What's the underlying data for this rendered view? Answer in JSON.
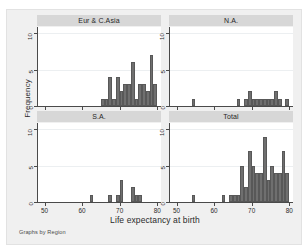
{
  "figure": {
    "xlabel": "Life expectancy at birth",
    "ylabel": "Frequency",
    "note": "Graphs by Region",
    "bar_color": "#6f6f6f",
    "panel_header_color": "#d7d7d7",
    "graph_bg_color": "#f0f0f0",
    "plot_bg_color": "#ffffff"
  },
  "chart_data": {
    "type": "bar",
    "title": "",
    "subtitle": "",
    "xlabel": "Life expectancy at birth",
    "ylabel": "Frequency",
    "note": "Graphs by Region",
    "grid": true,
    "legend": "none",
    "xlim": [
      48,
      81
    ],
    "ylim": [
      0,
      11
    ],
    "xticks": [
      50,
      60,
      70,
      80
    ],
    "yticks": [
      0,
      5,
      10
    ],
    "bin_width": 1,
    "panels": [
      {
        "name": "Eur & C.Asia",
        "row": 0,
        "col": 0,
        "x": [
          65,
          66,
          67,
          68,
          69,
          70,
          71,
          72,
          73,
          74,
          75,
          76,
          77,
          78,
          79
        ],
        "values": [
          1,
          1,
          4,
          1,
          4,
          2,
          3,
          3,
          6,
          1,
          3,
          3,
          2,
          7,
          3
        ]
      },
      {
        "name": "N.A.",
        "row": 0,
        "col": 1,
        "x": [
          54,
          62,
          66,
          67,
          68,
          69,
          70,
          71,
          72,
          73,
          74,
          75,
          76,
          77,
          79
        ],
        "values": [
          1,
          0,
          1,
          0,
          1,
          2,
          1,
          1,
          1,
          1,
          1,
          1,
          2,
          1,
          1
        ]
      },
      {
        "name": "S.A.",
        "row": 1,
        "col": 0,
        "x": [
          62,
          67,
          69,
          70,
          73,
          74,
          75
        ],
        "values": [
          1,
          1,
          1,
          3,
          2,
          1,
          1
        ]
      },
      {
        "name": "Total",
        "row": 1,
        "col": 1,
        "x": [
          54,
          62,
          64,
          65,
          66,
          67,
          68,
          69,
          70,
          71,
          72,
          73,
          74,
          75,
          76,
          77,
          78,
          79
        ],
        "values": [
          1,
          1,
          1,
          1,
          1,
          5,
          2,
          7,
          5,
          4,
          4,
          9,
          3,
          5,
          4,
          4,
          7,
          4
        ]
      }
    ]
  }
}
